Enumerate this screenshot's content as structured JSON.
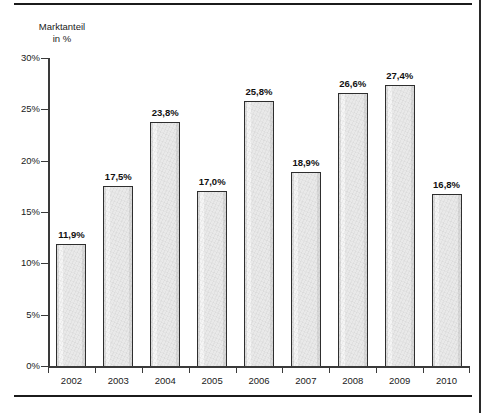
{
  "chart_data": {
    "type": "bar",
    "title": "",
    "subtitle": "",
    "xlabel": "",
    "ylabel": "Marktanteil in %",
    "ylabel_line1": "Marktanteil",
    "ylabel_line2": "in %",
    "categories": [
      "2002",
      "2003",
      "2004",
      "2005",
      "2006",
      "2007",
      "2008",
      "2009",
      "2010"
    ],
    "values": [
      11.9,
      17.5,
      23.8,
      17.0,
      25.8,
      18.9,
      26.6,
      27.4,
      16.8
    ],
    "value_labels": [
      "11,9%",
      "17,5%",
      "23,8%",
      "17,0%",
      "25,8%",
      "18,9%",
      "26,6%",
      "27,4%",
      "16,8%"
    ],
    "ylim": [
      0,
      30
    ],
    "ytick_values": [
      0,
      5,
      10,
      15,
      20,
      25,
      30
    ],
    "ytick_labels": [
      "0%",
      "5%",
      "10%",
      "15%",
      "20%",
      "25%",
      "30%"
    ],
    "grid": false,
    "legend": false,
    "legend_position": "none",
    "bar_fill_color": "#e9e9e9",
    "bar_border_color": "#2e2e2e",
    "axis_color": "#3a3a3a",
    "text_color": "#1a1a1a",
    "background_color": "#ffffff"
  }
}
